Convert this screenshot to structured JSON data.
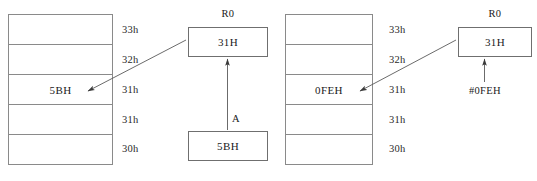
{
  "diagram": {
    "stroke_color": "#8a8a8a",
    "text_color": "#1a1a1a",
    "panels": [
      {
        "id": "left",
        "operation": "mov-r0-from-accumulator",
        "memory": {
          "cells": [
            {
              "address": "33h",
              "value": ""
            },
            {
              "address": "32h",
              "value": ""
            },
            {
              "address": "31h",
              "value": "5BH"
            },
            {
              "address": "31h",
              "value": ""
            },
            {
              "address": "30h",
              "value": ""
            }
          ]
        },
        "register": {
          "caption": "R0",
          "value": "31H"
        },
        "source": {
          "caption": "A",
          "value": "5BH"
        }
      },
      {
        "id": "right",
        "operation": "mov-r0-immediate",
        "memory": {
          "cells": [
            {
              "address": "33h",
              "value": ""
            },
            {
              "address": "32h",
              "value": ""
            },
            {
              "address": "31h",
              "value": "0FEH"
            },
            {
              "address": "31h",
              "value": ""
            },
            {
              "address": "30h",
              "value": ""
            }
          ]
        },
        "register": {
          "caption": "R0",
          "value": "31H"
        },
        "source": {
          "caption": "",
          "value": "#0FEH"
        }
      }
    ]
  }
}
